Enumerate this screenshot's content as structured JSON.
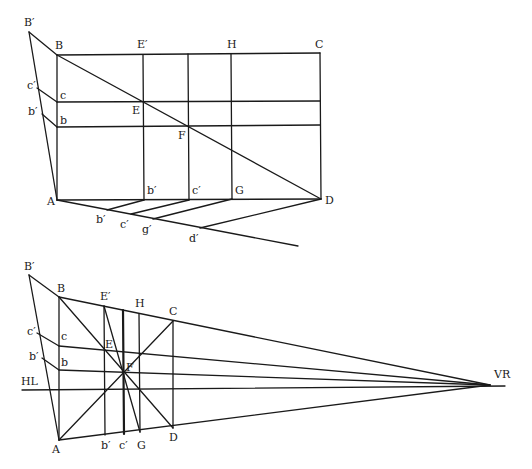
{
  "top_figure": {
    "labels": {
      "Bp": "B′",
      "B": "B",
      "Ep": "E′",
      "H": "H",
      "C": "C",
      "cp": "c′",
      "c": "c",
      "bp": "b′",
      "b": "b",
      "E": "E",
      "F": "F",
      "A": "A",
      "D": "D",
      "bp_base": "b′",
      "cp_base": "c′",
      "G": "G",
      "bp_low": "b′",
      "cp_low": "c′",
      "gp_low": "g′",
      "dp_low": "d′"
    }
  },
  "bottom_figure": {
    "labels": {
      "Bp": "B′",
      "B": "B",
      "Ep": "E′",
      "H": "H",
      "C": "C",
      "cp": "c′",
      "c": "c",
      "bp": "b′",
      "b": "b",
      "E": "E",
      "F": "F",
      "HL": "HL",
      "VR": "VR",
      "A": "A",
      "bp_base": "b′",
      "cp_base": "c′",
      "G": "G",
      "D": "D"
    }
  }
}
